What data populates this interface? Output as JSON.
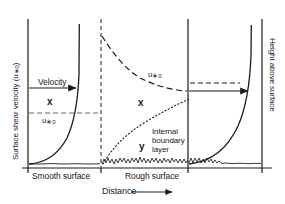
{
  "figure": {
    "axes": {
      "y_left_label": "Surface shear velocity (u*0)",
      "y_right_label": "Height above surface",
      "x_label": "Distance"
    },
    "sections": [
      {
        "name": "smooth",
        "label": "Smooth surface"
      },
      {
        "name": "rough",
        "label": "Rough surface"
      }
    ],
    "annotations": {
      "velocity_arrow": "Velocity",
      "shear_velocity_left": "u*0",
      "shear_velocity_mid": "u*0",
      "marker_x_left": "x",
      "marker_x_mid": "x",
      "marker_y_mid": "y",
      "internal_boundary_layer_line1": "Internal",
      "internal_boundary_layer_line2": "boundary",
      "internal_boundary_layer_line3": "layer",
      "internal_boundary_layer_full": "Internal boundary layer"
    },
    "colors": {
      "line": "#1a1a1a",
      "background": "#ffffff",
      "dashed_guide": "#555555"
    }
  },
  "chart_data": {
    "type": "line",
    "xlabel": "Distance",
    "ylabel": "Surface shear velocity (u*0)",
    "ylabel_secondary": "Height above surface",
    "grid": false,
    "legend": "none",
    "categories": [
      "Smooth surface",
      "Rough surface"
    ],
    "series": [
      {
        "name": "Velocity profile over smooth surface",
        "style": "solid",
        "description": "Logarithmic velocity profile rising steeply near the top",
        "points": [
          [
            29,
            164
          ],
          [
            38,
            160
          ],
          [
            48,
            152
          ],
          [
            58,
            139
          ],
          [
            66,
            122
          ],
          [
            72,
            104
          ],
          [
            76,
            84
          ],
          [
            78,
            62
          ],
          [
            79,
            40
          ],
          [
            79,
            24
          ]
        ]
      },
      {
        "name": "Surface shear velocity decay u*0 over rough surface",
        "style": "dashed",
        "description": "Shear velocity decays downwind across the rough surface",
        "points": [
          [
            102,
            38
          ],
          [
            112,
            48
          ],
          [
            124,
            62
          ],
          [
            138,
            74
          ],
          [
            152,
            82
          ],
          [
            166,
            87
          ],
          [
            180,
            90
          ],
          [
            187,
            91
          ]
        ]
      },
      {
        "name": "Internal boundary layer",
        "style": "dotted",
        "description": "Internal boundary layer grows in height downwind of the roughness change",
        "points": [
          [
            103,
            163
          ],
          [
            114,
            150
          ],
          [
            126,
            138
          ],
          [
            140,
            127
          ],
          [
            154,
            118
          ],
          [
            168,
            110
          ],
          [
            180,
            104
          ],
          [
            188,
            100
          ]
        ]
      },
      {
        "name": "Velocity profile over rough surface",
        "style": "solid",
        "description": "Logarithmic velocity profile, thicker boundary layer than smooth case",
        "points": [
          [
            189,
            164
          ],
          [
            200,
            161
          ],
          [
            212,
            155
          ],
          [
            224,
            145
          ],
          [
            234,
            130
          ],
          [
            242,
            110
          ],
          [
            247,
            86
          ],
          [
            250,
            58
          ],
          [
            251,
            36
          ],
          [
            251,
            25
          ]
        ]
      }
    ],
    "guides": [
      {
        "name": "smooth-u-star-dashed-level",
        "style": "dashed",
        "y": 113,
        "x_from": 29,
        "x_to": 101
      },
      {
        "name": "rough-u-star-dashed-level",
        "style": "dashed",
        "y": 91,
        "x_from": 188,
        "x_to": 240
      },
      {
        "name": "velocity-arrow-smooth",
        "style": "arrow",
        "y": 88,
        "x_from": 29,
        "x_to": 79
      },
      {
        "name": "velocity-arrow-rough",
        "style": "arrow",
        "y": 91,
        "x_from": 189,
        "x_to": 250
      }
    ],
    "boundaries": [
      {
        "name": "left-axis",
        "x": 28,
        "style": "solid"
      },
      {
        "name": "smooth-rough-divider",
        "x": 101,
        "style": "dashed"
      },
      {
        "name": "mid-right-divider",
        "x": 188,
        "style": "solid"
      },
      {
        "name": "right-axis",
        "x": 262,
        "style": "solid"
      },
      {
        "name": "baseline",
        "y": 168,
        "style": "solid"
      }
    ]
  }
}
